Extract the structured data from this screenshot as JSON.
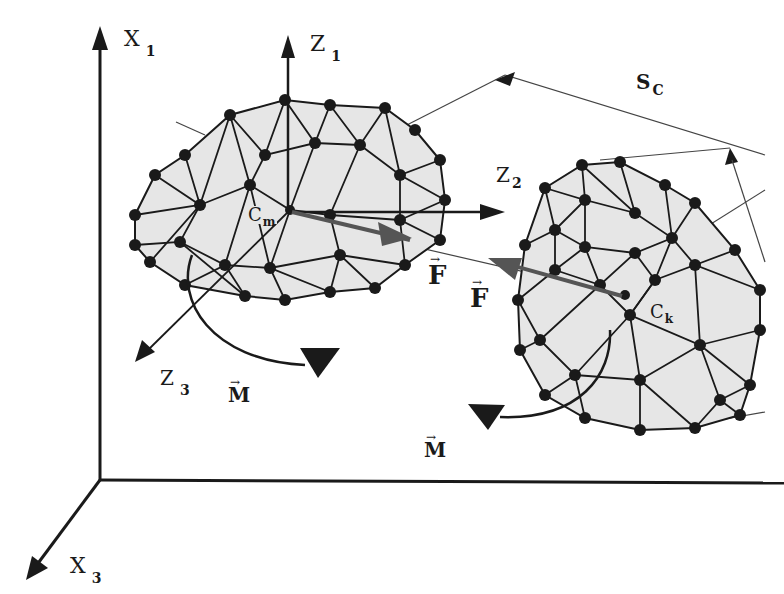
{
  "diagram": {
    "colors": {
      "background": "#ffffff",
      "mesh_fill": "#e6e6e6",
      "mesh_edge": "#1a1a1a",
      "node": "#1a1a1a",
      "force_arrow": "#555555",
      "thin_line": "#444444"
    },
    "global_axes": {
      "x1": {
        "label": "X",
        "subscript": "1"
      },
      "x3": {
        "label": "X",
        "subscript": "3"
      }
    },
    "local_axes": {
      "z1": {
        "label": "Z",
        "subscript": "1"
      },
      "z2": {
        "label": "Z",
        "subscript": "2"
      },
      "z3": {
        "label": "Z",
        "subscript": "3"
      }
    },
    "bodies": [
      {
        "name": "body-m",
        "center_label": "C",
        "center_subscript": "m"
      },
      {
        "name": "body-k",
        "center_label": "C",
        "center_subscript": "k"
      }
    ],
    "vectors": {
      "force_1": {
        "symbol": "F",
        "arrow": "→"
      },
      "force_2": {
        "symbol": "F",
        "arrow": "→"
      },
      "moment_1": {
        "symbol": "M",
        "arrow": "→"
      },
      "moment_2": {
        "symbol": "M",
        "arrow": "→"
      }
    },
    "contact_surface": {
      "label": "S",
      "subscript": "C"
    }
  }
}
